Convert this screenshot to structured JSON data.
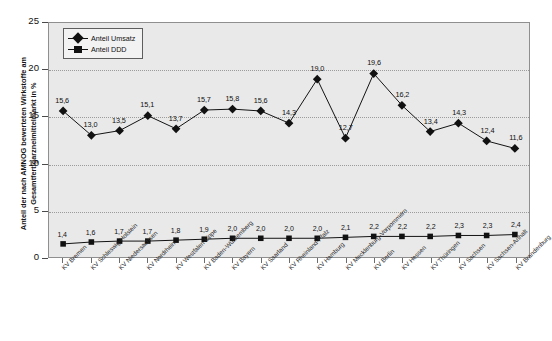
{
  "chart_data": {
    "type": "line",
    "title": "",
    "xlabel": "",
    "ylabel": "Anteil der nach AMNOG bewerteten Wirkstoffe am Gesamtfertigarzneimittelmarkt in %",
    "ylim": [
      0,
      25
    ],
    "yticks": [
      0,
      5,
      10,
      15,
      20,
      25
    ],
    "grid": true,
    "legend_position": "top-left",
    "categories": [
      "KV Bremen",
      "KV Schleswig-Holstein",
      "KV Niedersachsen",
      "KV Nordrhein",
      "KV Westfalen-Lippe",
      "KV Baden-Württemberg",
      "KV Bayern",
      "KV Saarland",
      "KV Rheinland-Pfalz",
      "KV Hamburg",
      "KV Mecklenburg-Vorpommern",
      "KV Berlin",
      "KV Hessen",
      "KV Thüringen",
      "KV Sachsen",
      "KV Sachsen-Anhalt",
      "KV Brandenburg"
    ],
    "series": [
      {
        "name": "Anteil Umsatz",
        "marker": "diamond",
        "color": "#111111",
        "values": [
          15.6,
          13.0,
          13.5,
          15.1,
          13.7,
          15.7,
          15.8,
          15.6,
          14.3,
          19.0,
          12.7,
          19.6,
          16.2,
          13.4,
          14.3,
          12.4,
          11.6
        ],
        "labels": [
          "15,6",
          "13,0",
          "13,5",
          "15,1",
          "13,7",
          "15,7",
          "15,8",
          "15,6",
          "14,3",
          "19,0",
          "12,7",
          "19,6",
          "16,2",
          "13,4",
          "14,3",
          "12,4",
          "11,6"
        ]
      },
      {
        "name": "Anteil DDD",
        "marker": "square",
        "color": "#111111",
        "values": [
          1.4,
          1.6,
          1.7,
          1.7,
          1.8,
          1.9,
          2.0,
          2.0,
          2.0,
          2.0,
          2.1,
          2.2,
          2.2,
          2.2,
          2.3,
          2.3,
          2.4
        ],
        "labels": [
          "1,4",
          "1,6",
          "1,7",
          "1,7",
          "1,8",
          "1,9",
          "2,0",
          "2,0",
          "2,0",
          "2,0",
          "2,1",
          "2,2",
          "2,2",
          "2,2",
          "2,3",
          "2,3",
          "2,4"
        ]
      }
    ],
    "ytick_labels": [
      "0",
      "5",
      "10",
      "15",
      "20",
      "25"
    ],
    "legend_entries": [
      "Anteil Umsatz",
      "Anteil DDD"
    ]
  }
}
